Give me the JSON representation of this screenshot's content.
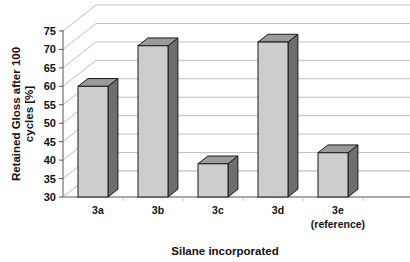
{
  "chart_data": {
    "type": "bar",
    "title": "",
    "subtitle": "",
    "xlabel": "Silane incorporated",
    "ylabel": "Retained Gloss after 100 cycles [%]",
    "ylabel_lines": [
      "Retained Gloss after 100",
      "cycles [%]"
    ],
    "categories": [
      "3a",
      "3b",
      "3c",
      "3d",
      "3e"
    ],
    "category_sublabels": [
      "",
      "",
      "",
      "",
      "(reference)"
    ],
    "values": [
      60,
      71,
      39,
      72,
      42
    ],
    "ylim": [
      30,
      75
    ],
    "ytick_step": 5,
    "yticks": [
      30,
      35,
      40,
      45,
      50,
      55,
      60,
      65,
      70,
      75
    ],
    "ytick_labels": [
      "30",
      "35",
      "40",
      "45",
      "50",
      "55",
      "60",
      "65",
      "70",
      "75"
    ],
    "grid": true,
    "grid_axis": "y",
    "legend": false,
    "legend_position": "none",
    "style": "3d-column",
    "colors": {
      "bar_front": "#cdcdcd",
      "bar_side": "#6e6e6e",
      "bar_top": "#9a9a9a",
      "bar_outline": "#1a1a1a",
      "gridline": "#bfbfbf",
      "axis": "#555555",
      "floor": "#ffffff",
      "text": "#111111",
      "background": "#ffffff"
    },
    "annotations": []
  }
}
